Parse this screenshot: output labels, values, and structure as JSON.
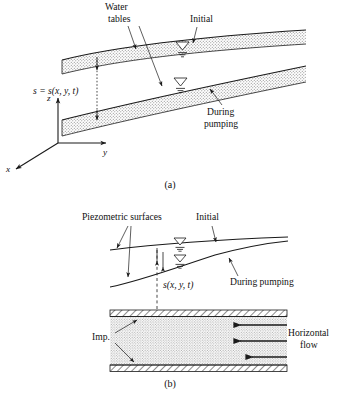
{
  "figure": {
    "title_a": "(a)",
    "title_b": "(b)",
    "panel_a": {
      "label_water_tables_line1": "Water",
      "label_water_tables_line2": "tables",
      "label_initial": "Initial",
      "label_during_line1": "During",
      "label_during_line2": "pumping",
      "label_drawdown": "s = s(x, y, t)",
      "axis_z": "z",
      "axis_y": "y",
      "axis_x": "x",
      "icon_initial_well": "water-table-triangle-icon",
      "icon_pumping_well": "water-table-triangle-icon"
    },
    "panel_b": {
      "label_piezometric": "Piezometric surfaces",
      "label_initial": "Initial",
      "label_during_line1": "During",
      "label_during_line2": "pumping",
      "label_drawdown": "s(x, y, t)",
      "label_imp": "Imp.",
      "label_flow_line1": "Horizontal",
      "label_flow_line2": "flow",
      "icon_initial_well": "water-table-triangle-icon",
      "icon_pumping_well": "water-table-triangle-icon",
      "icon_flow_arrow": "left-arrow-icon"
    },
    "colors": {
      "ink": "#1a1a1a",
      "stipple": "#8a8a8a",
      "hatch": "#1a1a1a",
      "background": "#ffffff"
    }
  }
}
